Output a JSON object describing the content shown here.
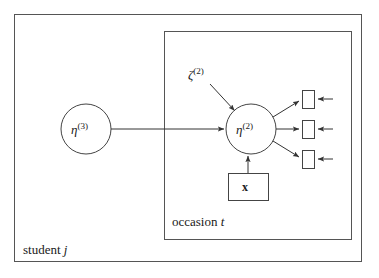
{
  "figure": {
    "type": "path-diagram",
    "background_color": "#ffffff",
    "line_color": "#333333"
  },
  "plates": {
    "outer": {
      "name": "student-plate",
      "label_prefix": "student",
      "label_index": "j",
      "x": 14,
      "y": 14,
      "width": 348,
      "height": 248
    },
    "inner": {
      "name": "occasion-plate",
      "label_prefix": "occasion",
      "label_index": "t",
      "x": 164,
      "y": 31,
      "width": 188,
      "height": 209
    }
  },
  "nodes": {
    "eta3": {
      "name": "eta-level3",
      "symbol": "η",
      "superscript": "(3)",
      "shape": "circle",
      "cx": 86,
      "cy": 129,
      "r": 25
    },
    "eta2": {
      "name": "eta-level2",
      "symbol": "η",
      "superscript": "(2)",
      "shape": "circle",
      "cx": 251,
      "cy": 129,
      "r": 25
    },
    "zeta2": {
      "name": "zeta-disturbance",
      "symbol": "ζ",
      "superscript": "(2)",
      "shape": "label-only",
      "x": 188,
      "y": 67
    },
    "covariate": {
      "name": "covariate-box",
      "symbol": "x",
      "shape": "rectangle",
      "bold": true,
      "x": 228,
      "y": 173,
      "width": 40,
      "height": 27
    }
  },
  "indicators": [
    {
      "name": "indicator-1",
      "x": 302,
      "y": 90,
      "width": 12,
      "height": 18
    },
    {
      "name": "indicator-2",
      "x": 302,
      "y": 120,
      "width": 12,
      "height": 18
    },
    {
      "name": "indicator-3",
      "x": 302,
      "y": 150,
      "width": 12,
      "height": 18
    }
  ],
  "edges": [
    {
      "name": "edge-eta3-to-eta2",
      "from": "eta3",
      "to": "eta2",
      "style": "arrow"
    },
    {
      "name": "edge-zeta2-to-eta2",
      "from": "zeta2",
      "to": "eta2",
      "style": "arrow"
    },
    {
      "name": "edge-covariate-to-eta2",
      "from": "covariate",
      "to": "eta2",
      "style": "arrow"
    },
    {
      "name": "edge-eta2-to-indicator1",
      "from": "eta2",
      "to": "indicator-1",
      "style": "arrow"
    },
    {
      "name": "edge-eta2-to-indicator2",
      "from": "eta2",
      "to": "indicator-2",
      "style": "arrow"
    },
    {
      "name": "edge-eta2-to-indicator3",
      "from": "eta2",
      "to": "indicator-3",
      "style": "arrow"
    },
    {
      "name": "residual-arrow-1",
      "from": "right",
      "to": "indicator-1",
      "style": "arrow"
    },
    {
      "name": "residual-arrow-2",
      "from": "right",
      "to": "indicator-2",
      "style": "arrow"
    },
    {
      "name": "residual-arrow-3",
      "from": "right",
      "to": "indicator-3",
      "style": "arrow"
    }
  ],
  "labels": {
    "eta3_symbol": "η",
    "eta3_sup": "(3)",
    "eta2_symbol": "η",
    "eta2_sup": "(2)",
    "zeta2_symbol": "ζ",
    "zeta2_sup": "(2)",
    "covariate_symbol": "x",
    "occasion_text": "occasion",
    "occasion_index": "t",
    "student_text": "student",
    "student_index": "j"
  }
}
